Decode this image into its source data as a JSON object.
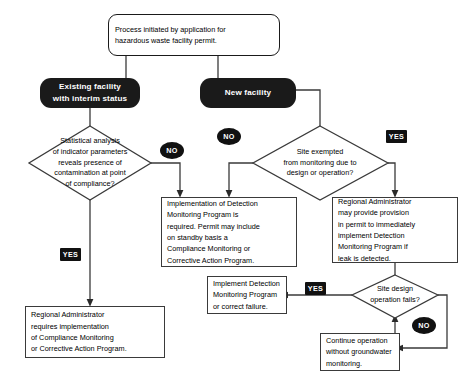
{
  "diagram": {
    "colors": {
      "node_fill": "#ffffff",
      "node_stroke": "#3a3a3a",
      "pill_fill": "#1a1a1a",
      "pill_text": "#ffffff",
      "badge_fill": "#111111",
      "badge_text": "#ffffff",
      "connector": "#3a3a3a",
      "background": "#ffffff"
    },
    "nodes": {
      "start": {
        "shape": "rounded-terminator",
        "line1": "Process initiated by application for",
        "line2": "hazardous waste facility permit."
      },
      "existing_facility": {
        "shape": "pill",
        "line1": "Existing facility",
        "line2": "with interim status"
      },
      "new_facility": {
        "shape": "pill",
        "line1": "New facility"
      },
      "decision_statistical": {
        "shape": "diamond",
        "line1": "Statistical analysis",
        "line2": "of indicator parameters",
        "line3": "reveals presence of",
        "line4": "contamination at point",
        "line5": "of compliance?"
      },
      "decision_exempted": {
        "shape": "diamond",
        "line1": "Site exempted",
        "line2": "from monitoring due to",
        "line3": "design or operation?"
      },
      "decision_site_design": {
        "shape": "diamond",
        "line1": "Site design",
        "line2": "operation fails?"
      },
      "detection_monitoring": {
        "shape": "process",
        "line1": "Implementation of Detection",
        "line2": "Monitoring Program is",
        "line3": "required. Permit may include",
        "line4": "on standby basis a",
        "line5": "Compliance Monitoring or",
        "line6": "Corrective Action Program."
      },
      "regional_provision": {
        "shape": "process",
        "line1": "Regional Administrator",
        "line2": "may provide provision",
        "line3": "in permit to immediately",
        "line4": "implement Detection",
        "line5": "Monitoring Program if",
        "line6": "leak is detected."
      },
      "regional_requires": {
        "shape": "process",
        "line1": "Regional Administrator",
        "line2": "requires implementation",
        "line3": "of Compliance Monitoring",
        "line4": "or Corrective Action Program."
      },
      "implement_detection": {
        "shape": "process",
        "line1": "Implement Detection",
        "line2": "Monitoring Program",
        "line3": "or correct failure."
      },
      "continue_operation": {
        "shape": "process",
        "line1": "Continue operation",
        "line2": "without groundwater",
        "line3": "monitoring."
      }
    },
    "badges": {
      "no_statistical": {
        "label": "NO",
        "shape": "oval"
      },
      "no_exempted": {
        "label": "NO",
        "shape": "oval"
      },
      "yes_exempted": {
        "label": "YES",
        "shape": "rect"
      },
      "yes_statistical": {
        "label": "YES",
        "shape": "rect"
      },
      "yes_site_design": {
        "label": "YES",
        "shape": "rect"
      },
      "no_site_design": {
        "label": "NO",
        "shape": "oval"
      }
    }
  }
}
